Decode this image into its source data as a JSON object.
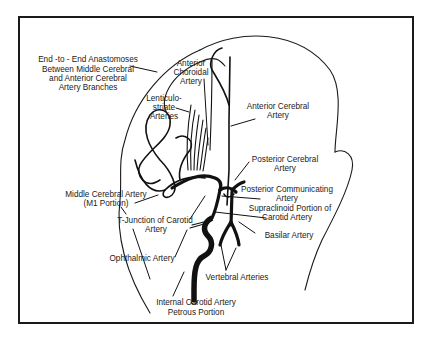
{
  "diagram": {
    "colors": {
      "line": "#111111",
      "background": "#ffffff",
      "text": "#1a1a1a"
    },
    "labels": {
      "anastomoses": [
        "End -to - End Anastomoses",
        "Between Middle Cerebral",
        "and Anterior Cerebral",
        "Artery Branches"
      ],
      "anterior_choroidal": [
        "Anterior",
        "Choroidal",
        "Artery"
      ],
      "lenticulostriate": [
        "Lenticulo-",
        "striate",
        "Arteries"
      ],
      "anterior_cerebral": [
        "Anterior Cerebral",
        "Artery"
      ],
      "posterior_cerebral": [
        "Posterior Cerebral",
        "Artery"
      ],
      "middle_cerebral": [
        "Middle Cerebral Artery",
        "(M1 Portion)"
      ],
      "posterior_communicating": [
        "Posterior Communicating",
        "Artery"
      ],
      "supraclinoid": [
        "Supraclinoid Portion of",
        "Carotid  Artery"
      ],
      "t_junction": [
        "T-Junction of  Carotid",
        "Artery"
      ],
      "basilar": [
        "Basilar Artery"
      ],
      "ophthalmic": [
        "Ophthalmic Artery"
      ],
      "vertebral": [
        "Vertebral Arteries"
      ],
      "internal_carotid_petrous": [
        "Internal Carotid Artery",
        "Petrous Portion"
      ]
    }
  }
}
